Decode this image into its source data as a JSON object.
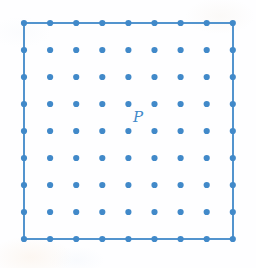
{
  "figure": {
    "background_color": "#fefeff",
    "accent_color": "#4189c9",
    "border_color": "#4189c9"
  },
  "lattice": {
    "rows": 9,
    "columns": 9,
    "total_points": 81,
    "origin_x": 24,
    "origin_y": 23,
    "spacing_x": 26.1,
    "spacing_y": 27.0,
    "dot_radius": 3.1,
    "dot_color": "#4189c9",
    "border_width": 1.8,
    "border_color": "#4189c9",
    "square_left": 24,
    "square_top": 23,
    "square_right": 233,
    "square_bottom": 239
  },
  "labels": {
    "p": {
      "text": "P",
      "row_index": 4,
      "column_index": 4,
      "left": 133,
      "top": 110,
      "color": "#4189c9"
    }
  }
}
